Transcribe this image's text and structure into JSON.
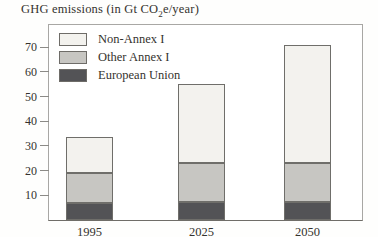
{
  "figure": {
    "title_pre": "GHG emissions (in Gt CO",
    "title_sub": "2",
    "title_post": "e/year)"
  },
  "chart_data": {
    "type": "bar",
    "stacked": true,
    "title": "GHG emissions (in Gt CO2e/year)",
    "unit": "Gt CO2e/year",
    "categories": [
      "1995",
      "2025",
      "2050"
    ],
    "series": [
      {
        "name": "European Union",
        "color": "#535356",
        "values": [
          7,
          7.5,
          7.5
        ]
      },
      {
        "name": "Other Annex I",
        "color": "#c7c6c2",
        "values": [
          12,
          15.5,
          15.5
        ]
      },
      {
        "name": "Non-Annex I",
        "color": "#f3f2ee",
        "values": [
          14.5,
          32,
          48
        ]
      }
    ],
    "totals": [
      33.5,
      55,
      71
    ],
    "y_ticks": [
      10,
      20,
      30,
      40,
      50,
      60,
      70
    ],
    "ylim": [
      0,
      79
    ],
    "grid": false,
    "legend": {
      "position": "top-left-inside",
      "entries": [
        "Non-Annex I",
        "Other Annex I",
        "European Union"
      ]
    }
  }
}
